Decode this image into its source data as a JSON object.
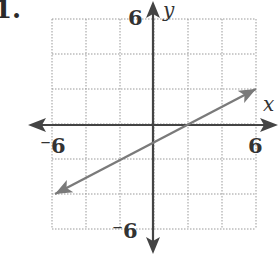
{
  "problem_number": "1.",
  "chart_data": {
    "type": "line",
    "title": "",
    "xlabel": "x",
    "ylabel": "y",
    "xlim": [
      -6,
      6
    ],
    "ylim": [
      -6,
      6
    ],
    "grid": true,
    "grid_step": 2,
    "tick_labels": {
      "x_min": "⁻6",
      "x_max": "6",
      "y_min": "⁻6",
      "y_max": "6"
    },
    "series": [
      {
        "name": "line",
        "equation": "y = 0.5x - 1",
        "x": [
          -6,
          6
        ],
        "y": [
          -4,
          2
        ],
        "arrows": "both",
        "color": "#7a7a7a"
      }
    ],
    "axis_color": "#444444",
    "grid_color": "#999999"
  }
}
